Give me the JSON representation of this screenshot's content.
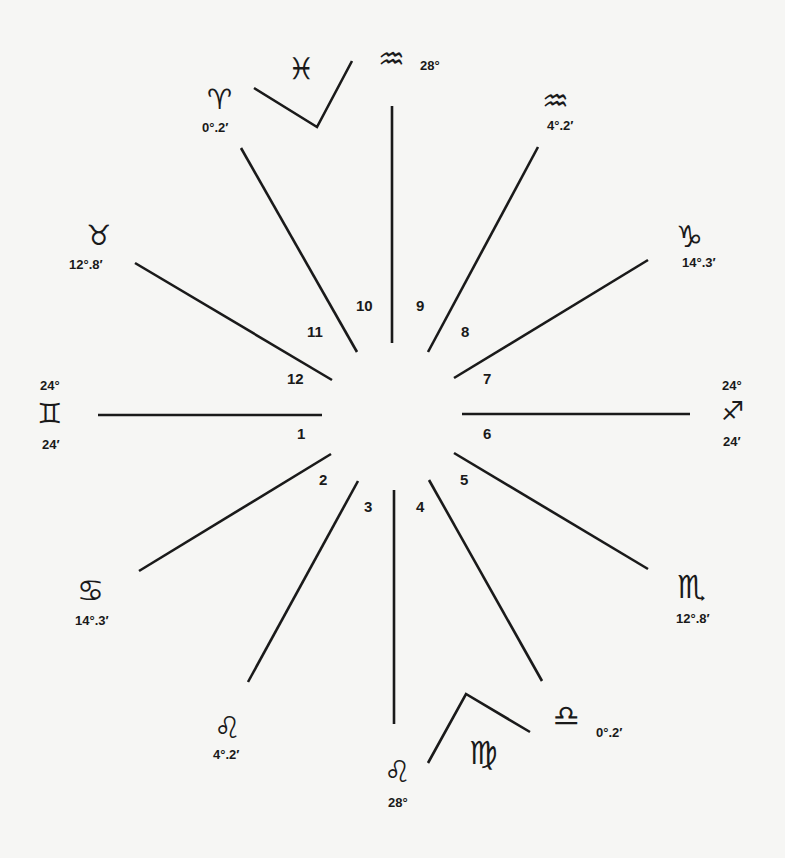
{
  "diagram": {
    "type": "astrological-house-chart",
    "background": "#f6f6f4",
    "line_color": "#1a1a1a",
    "houses": [
      {
        "number": "1",
        "x": 297,
        "y": 433
      },
      {
        "number": "2",
        "x": 319,
        "y": 479
      },
      {
        "number": "3",
        "x": 364,
        "y": 506
      },
      {
        "number": "4",
        "x": 416,
        "y": 506
      },
      {
        "number": "5",
        "x": 460,
        "y": 479
      },
      {
        "number": "6",
        "x": 483,
        "y": 433
      },
      {
        "number": "7",
        "x": 483,
        "y": 378
      },
      {
        "number": "8",
        "x": 461,
        "y": 331
      },
      {
        "number": "9",
        "x": 416,
        "y": 305
      },
      {
        "number": "10",
        "x": 356,
        "y": 305
      },
      {
        "number": "11",
        "x": 307,
        "y": 331
      },
      {
        "number": "12",
        "x": 287,
        "y": 378
      }
    ],
    "cusps": [
      {
        "sign": "Aquarius",
        "symbol": "♒",
        "degree": "28°"
      },
      {
        "sign": "Aquarius",
        "symbol": "♒",
        "degree": "4°.2′"
      },
      {
        "sign": "Capricorn",
        "symbol": "♑",
        "degree": "14°.3′"
      },
      {
        "sign": "Sagittarius",
        "symbol": "♐",
        "degree_top": "24°",
        "degree_bottom": "24′"
      },
      {
        "sign": "Scorpio",
        "symbol": "♏",
        "degree": "12°.8′"
      },
      {
        "sign": "Libra",
        "symbol": "♎",
        "degree": "0°.2′"
      },
      {
        "sign": "Leo",
        "symbol": "♌",
        "degree": "28°"
      },
      {
        "sign": "Leo",
        "symbol": "♌",
        "degree": "4°.2′"
      },
      {
        "sign": "Cancer",
        "symbol": "♋",
        "degree": "14°.3′"
      },
      {
        "sign": "Gemini",
        "symbol": "♊",
        "degree_top": "24°",
        "degree_bottom": "24′"
      },
      {
        "sign": "Taurus",
        "symbol": "♉",
        "degree": "12°.8′"
      },
      {
        "sign": "Aries",
        "symbol": "♈",
        "degree": "0°.2′"
      }
    ],
    "intercepted": [
      {
        "sign": "Pisces",
        "symbol": "♓"
      },
      {
        "sign": "Virgo",
        "symbol": "♍"
      }
    ]
  }
}
